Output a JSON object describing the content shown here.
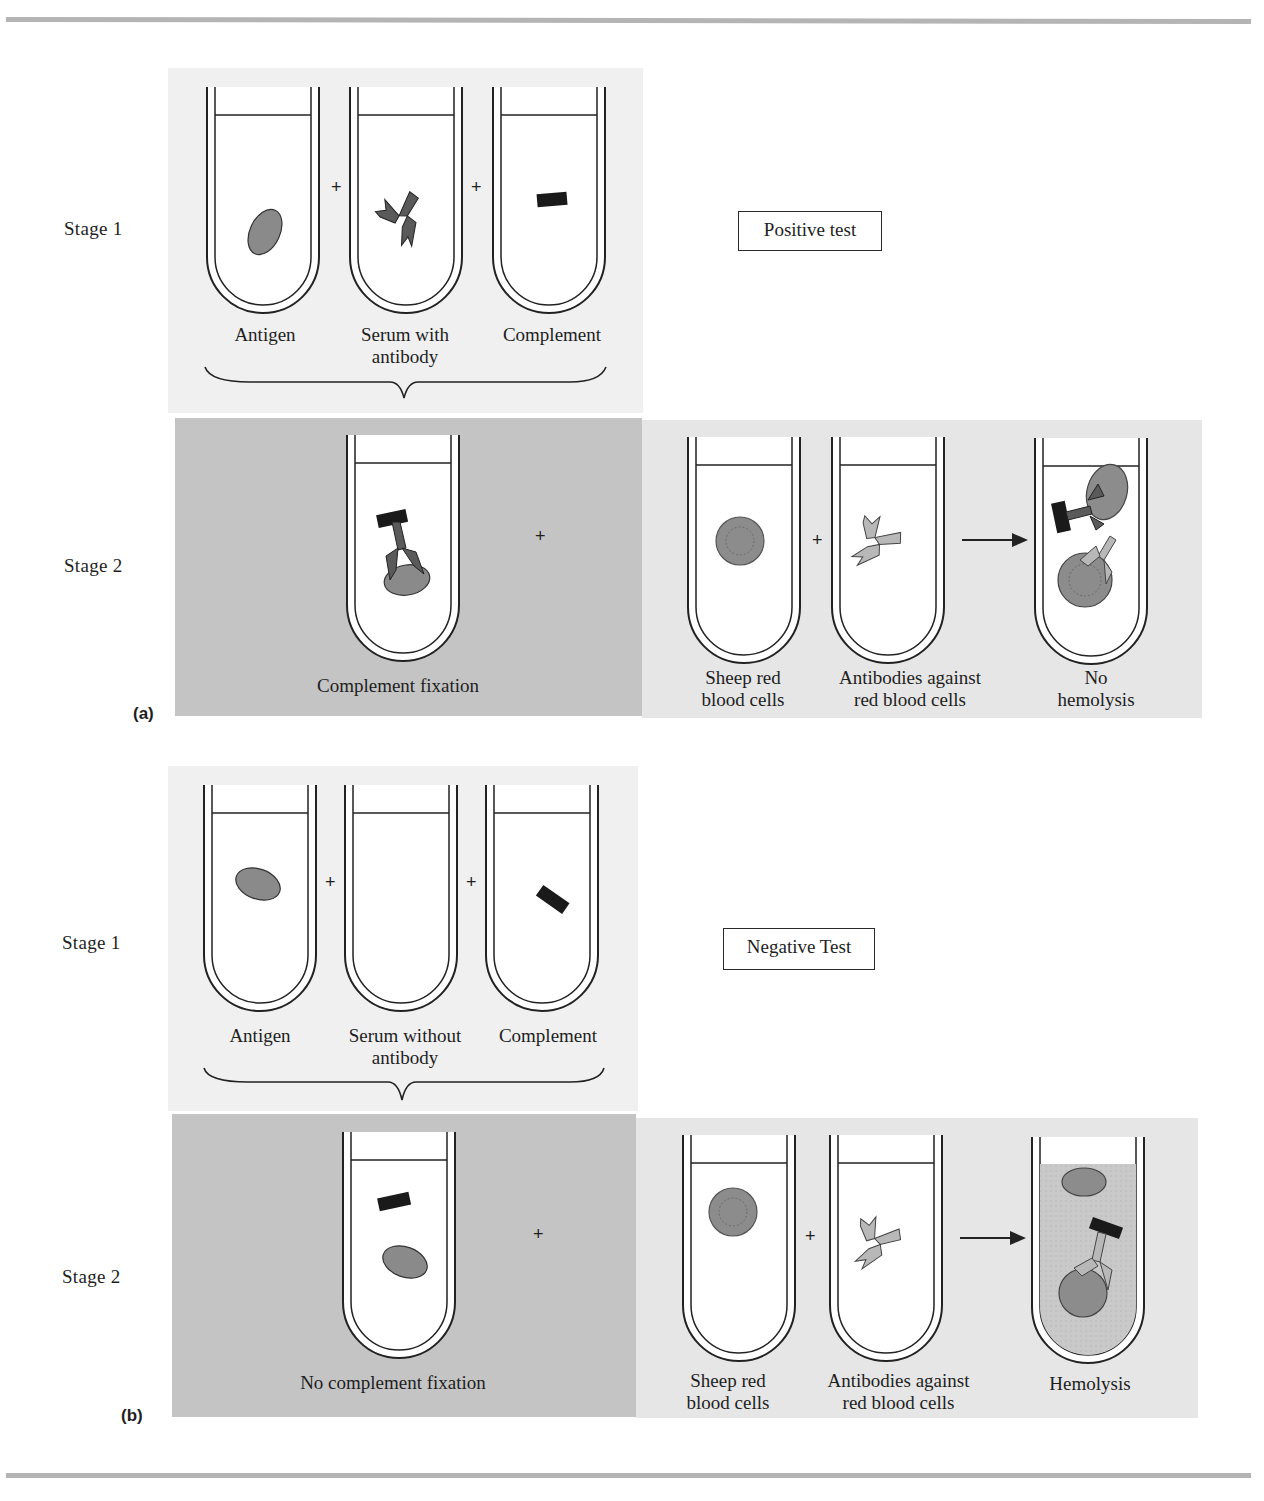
{
  "figure": {
    "colors": {
      "rule": "#b4b4b4",
      "panel_light": "#f0f0f0",
      "panel_dark": "#c4c4c4",
      "antigen": "#8a8a8a",
      "antibody_dark": "#5a5a5a",
      "antibody_light": "#b8b8b8",
      "complement": "#1a1a1a",
      "red_blood_cell": "#8c8c8c"
    },
    "part_a": {
      "label": "(a)",
      "test_label": "Positive test",
      "stage1": {
        "label": "Stage 1",
        "tubes": [
          {
            "caption": "Antigen",
            "content": "antigen-ellipse"
          },
          {
            "caption_line1": "Serum with",
            "caption_line2": "antibody",
            "content": "antibody"
          },
          {
            "caption": "Complement",
            "content": "complement-bar"
          }
        ],
        "operators": [
          "+",
          "+"
        ]
      },
      "stage2": {
        "label": "Stage 2",
        "left_caption": "Complement fixation",
        "plus": "+",
        "tubes": [
          {
            "caption_line1": "Sheep red",
            "caption_line2": "blood cells",
            "content": "red-blood-cell"
          },
          {
            "caption_line1": "Antibodies against",
            "caption_line2": "red  blood cells",
            "content": "anti-rbc-antibody"
          },
          {
            "caption_line1": "No",
            "caption_line2": "hemolysis",
            "content": "intact-cells"
          }
        ],
        "operators": [
          "+",
          "→"
        ]
      }
    },
    "part_b": {
      "label": "(b)",
      "test_label": "Negative Test",
      "stage1": {
        "label": "Stage 1",
        "tubes": [
          {
            "caption": "Antigen",
            "content": "antigen-ellipse"
          },
          {
            "caption_line1": "Serum without",
            "caption_line2": "antibody",
            "content": "empty"
          },
          {
            "caption": "Complement",
            "content": "complement-bar"
          }
        ],
        "operators": [
          "+",
          "+"
        ]
      },
      "stage2": {
        "label": "Stage 2",
        "left_caption": "No complement fixation",
        "plus": "+",
        "tubes": [
          {
            "caption_line1": "Sheep red",
            "caption_line2": "blood cells",
            "content": "red-blood-cell"
          },
          {
            "caption_line1": "Antibodies  against",
            "caption_line2": "red  blood cells",
            "content": "anti-rbc-antibody"
          },
          {
            "caption": "Hemolysis",
            "content": "lysed-cell"
          }
        ],
        "operators": [
          "+",
          "→"
        ]
      }
    }
  }
}
